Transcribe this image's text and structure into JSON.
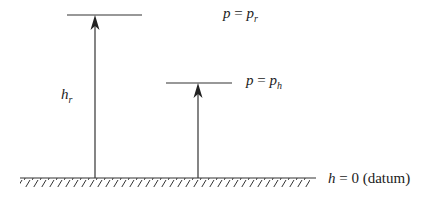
{
  "diagram": {
    "labels": {
      "top_level": {
        "var": "p",
        "eq": " = ",
        "rhs": "p",
        "rhs_sub": "r"
      },
      "mid_level": {
        "var": "p",
        "eq": " = ",
        "rhs": "p",
        "rhs_sub": "h"
      },
      "height_label": {
        "var": "h",
        "sub": "r"
      },
      "datum": {
        "var": "h",
        "rest": " = 0 (datum)"
      }
    },
    "colors": {
      "line": "#333333",
      "text": "#222222"
    }
  }
}
